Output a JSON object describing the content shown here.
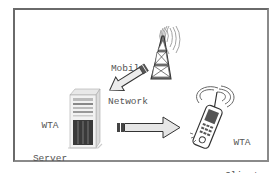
{
  "diagram": {
    "nodes": [
      {
        "id": "mobile-network",
        "label_lines": [
          "Mobile",
          "Network"
        ],
        "icon": "radio-tower-icon"
      },
      {
        "id": "wta-server",
        "label_lines": [
          "WTA",
          "Server"
        ],
        "icon": "server-tower-icon"
      },
      {
        "id": "wta-client",
        "label_lines": [
          "WTA",
          "Client"
        ],
        "icon": "mobile-phone-icon"
      }
    ],
    "edges": [
      {
        "from": "mobile-network",
        "to": "wta-server",
        "style": "block-arrow"
      },
      {
        "from": "wta-server",
        "to": "wta-client",
        "style": "block-arrow"
      }
    ]
  },
  "colors": {
    "frame_border": "#6a6a6a",
    "text": "#555555",
    "icon_stroke": "#555555",
    "arrow_fill": "#e6e6e6"
  }
}
